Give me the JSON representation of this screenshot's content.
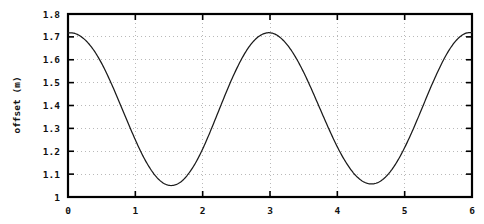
{
  "chart_data": {
    "type": "line",
    "title": "",
    "xlabel": "",
    "ylabel": "offset (m)",
    "xlim": [
      0,
      6
    ],
    "ylim": [
      1.0,
      1.8
    ],
    "xticks": [
      "0",
      "1",
      "2",
      "3",
      "4",
      "5",
      "6"
    ],
    "yticks": [
      "1",
      "1.1",
      "1.2",
      "1.3",
      "1.4",
      "1.5",
      "1.6",
      "1.7",
      "1.8"
    ],
    "grid": true,
    "legend": null,
    "series": [
      {
        "name": "offset",
        "color": "#1a1a1a",
        "description": "sinusoidal oscillation, period 2.2, amplitude 0.335, mean 1.385, peak near x=0, 2.15, 4.4",
        "x": [
          0.0,
          0.1,
          0.2,
          0.3,
          0.4,
          0.5,
          0.6,
          0.7,
          0.8,
          0.9,
          1.0,
          1.1,
          1.2,
          1.3,
          1.4,
          1.5,
          1.6,
          1.7,
          1.8,
          1.9,
          2.0,
          2.1,
          2.2,
          2.3,
          2.4,
          2.5,
          2.6,
          2.7,
          2.8,
          2.9,
          3.0,
          3.1,
          3.2,
          3.3,
          3.4,
          3.5,
          3.6,
          3.7,
          3.8,
          3.9,
          4.0,
          4.1,
          4.2,
          4.3,
          4.4,
          4.5,
          4.6,
          4.7,
          4.8,
          4.9,
          5.0,
          5.1,
          5.2,
          5.3,
          5.4,
          5.5,
          5.6,
          5.7,
          5.8,
          5.9,
          6.0
        ],
        "y": [
          1.718,
          1.715,
          1.7,
          1.673,
          1.634,
          1.584,
          1.524,
          1.458,
          1.388,
          1.318,
          1.25,
          1.187,
          1.134,
          1.092,
          1.064,
          1.051,
          1.054,
          1.072,
          1.106,
          1.152,
          1.21,
          1.277,
          1.349,
          1.422,
          1.493,
          1.558,
          1.615,
          1.661,
          1.694,
          1.713,
          1.718,
          1.708,
          1.684,
          1.648,
          1.601,
          1.545,
          1.482,
          1.415,
          1.347,
          1.281,
          1.219,
          1.165,
          1.12,
          1.086,
          1.065,
          1.057,
          1.063,
          1.083,
          1.116,
          1.161,
          1.216,
          1.279,
          1.347,
          1.418,
          1.488,
          1.553,
          1.612,
          1.66,
          1.695,
          1.715,
          1.719
        ]
      }
    ]
  },
  "axes": {
    "x_tick_values": [
      0,
      1,
      2,
      3,
      4,
      5,
      6
    ],
    "y_tick_values": [
      1.0,
      1.1,
      1.2,
      1.3,
      1.4,
      1.5,
      1.6,
      1.7,
      1.8
    ]
  },
  "colors": {
    "curve": "#1a1a1a",
    "frame": "#000000",
    "grid": "#b9b9b9",
    "background": "#ffffff"
  }
}
